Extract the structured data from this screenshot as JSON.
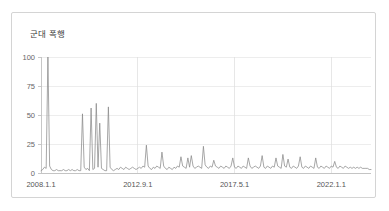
{
  "card": {
    "title": "군대 폭행",
    "border_color": "#d4d4d4",
    "background": "#ffffff"
  },
  "chart_data": {
    "type": "line",
    "title": "군대 폭행",
    "subtitle": "",
    "xlabel": "",
    "ylabel": "",
    "ylim": [
      0,
      100
    ],
    "yticks": [
      0,
      25,
      50,
      75,
      100
    ],
    "ytick_labels": [
      "0",
      "25",
      "50",
      "75",
      "100"
    ],
    "xtick_labels": [
      "2008.1.1",
      "2012.9.1",
      "2017.5.1",
      "2022.1.1"
    ],
    "xtick_indices": [
      0,
      56,
      112,
      168
    ],
    "grid": true,
    "grid_horizontal": true,
    "grid_vertical": true,
    "legend": false,
    "legend_position": "none",
    "line_color": "#8a8a8a",
    "line_width": 0.75,
    "x_start": "2007.9.1",
    "x_end": "2023.9.1",
    "x_interval": "monthly",
    "series": [
      {
        "name": "군대 폭행",
        "values": [
          2,
          3,
          5,
          4,
          100,
          6,
          3,
          2,
          2,
          3,
          2,
          2,
          2,
          3,
          2,
          2,
          3,
          2,
          3,
          2,
          2,
          3,
          2,
          2,
          51,
          5,
          3,
          4,
          2,
          56,
          3,
          4,
          60,
          5,
          43,
          4,
          3,
          2,
          2,
          57,
          5,
          3,
          2,
          3,
          4,
          3,
          5,
          4,
          3,
          5,
          4,
          3,
          4,
          5,
          4,
          3,
          4,
          5,
          4,
          6,
          5,
          24,
          6,
          4,
          3,
          5,
          4,
          6,
          5,
          4,
          18,
          6,
          4,
          3,
          5,
          4,
          3,
          5,
          4,
          6,
          5,
          14,
          6,
          5,
          4,
          13,
          5,
          15,
          6,
          4,
          5,
          6,
          5,
          4,
          23,
          7,
          5,
          4,
          6,
          5,
          11,
          6,
          5,
          4,
          6,
          5,
          4,
          6,
          5,
          4,
          6,
          13,
          5,
          4,
          6,
          5,
          4,
          6,
          5,
          4,
          13,
          6,
          4,
          5,
          6,
          5,
          4,
          6,
          15,
          5,
          4,
          6,
          5,
          4,
          6,
          5,
          13,
          6,
          5,
          4,
          16,
          6,
          5,
          12,
          5,
          4,
          6,
          5,
          4,
          6,
          14,
          5,
          4,
          6,
          5,
          4,
          6,
          5,
          4,
          13,
          5,
          4,
          6,
          5,
          4,
          6,
          5,
          4,
          6,
          5,
          10,
          5,
          4,
          6,
          5,
          4,
          6,
          5,
          4,
          5,
          4,
          5,
          4,
          5,
          4,
          5,
          4,
          4,
          4,
          4,
          3,
          3
        ]
      }
    ],
    "peaks": [
      {
        "label": "2008.1.1",
        "value": 100
      },
      {
        "label": "2009 cluster",
        "value": 51
      },
      {
        "label": "2009 cluster",
        "value": 56
      },
      {
        "label": "2010 cluster",
        "value": 60
      },
      {
        "label": "2010 cluster",
        "value": 43
      },
      {
        "label": "2011",
        "value": 57
      },
      {
        "label": "2012",
        "value": 24
      },
      {
        "label": "2014",
        "value": 23
      }
    ]
  }
}
